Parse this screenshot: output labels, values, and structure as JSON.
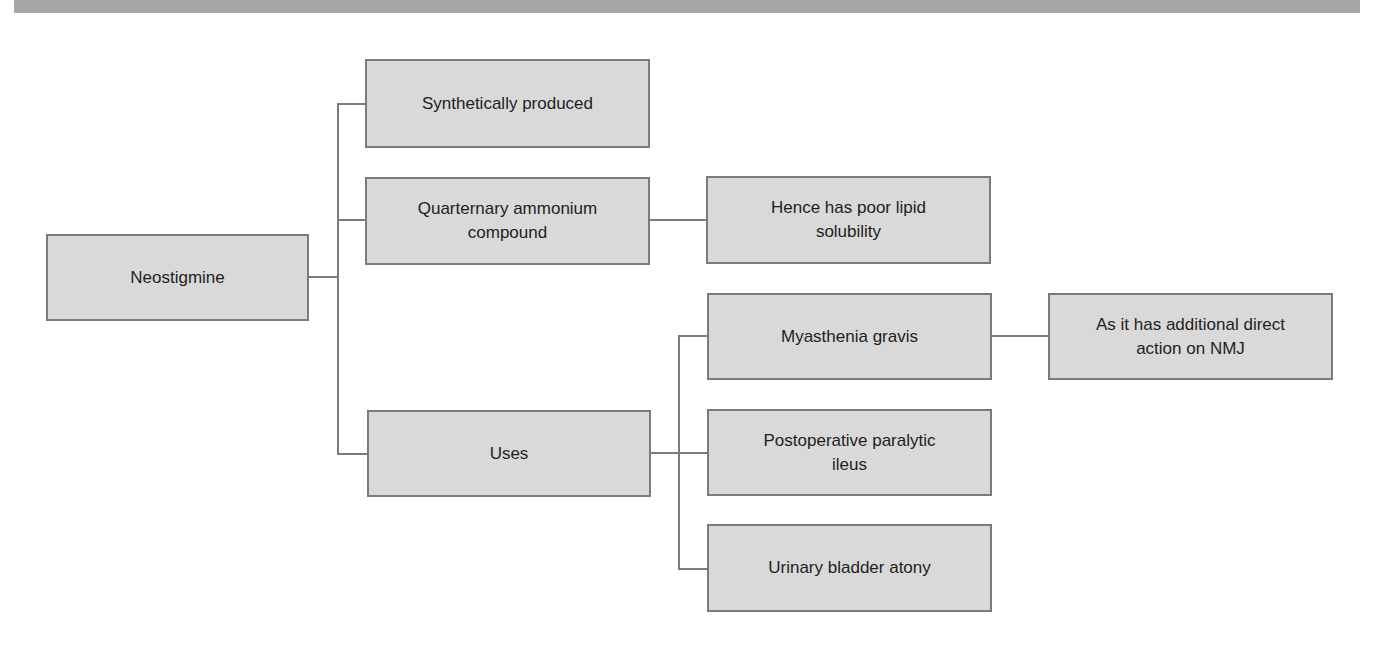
{
  "diagram": {
    "title": "",
    "colors": {
      "node_fill": "#d9d9d9",
      "node_border": "#7b7b7b",
      "connector": "#7b7b7b",
      "top_band": "#a7a7a7",
      "text": "#1e1e1e"
    },
    "root": {
      "id": "neostigmine",
      "label": "Neostigmine"
    },
    "nodes": {
      "synthetically_produced": {
        "label": "Synthetically produced"
      },
      "quarternary": {
        "label": "Quarternary ammonium\ncompound"
      },
      "poor_lipid": {
        "label": "Hence has poor lipid\nsolubility"
      },
      "uses": {
        "label": "Uses"
      },
      "myasthenia": {
        "label": "Myasthenia gravis"
      },
      "nmj_action": {
        "label": "As it has additional direct\naction on NMJ"
      },
      "ileus": {
        "label": "Postoperative paralytic\nileus"
      },
      "bladder": {
        "label": "Urinary bladder atony"
      }
    },
    "edges": [
      [
        "neostigmine",
        "synthetically_produced"
      ],
      [
        "neostigmine",
        "quarternary"
      ],
      [
        "neostigmine",
        "uses"
      ],
      [
        "quarternary",
        "poor_lipid"
      ],
      [
        "uses",
        "myasthenia"
      ],
      [
        "uses",
        "ileus"
      ],
      [
        "uses",
        "bladder"
      ],
      [
        "myasthenia",
        "nmj_action"
      ]
    ]
  }
}
